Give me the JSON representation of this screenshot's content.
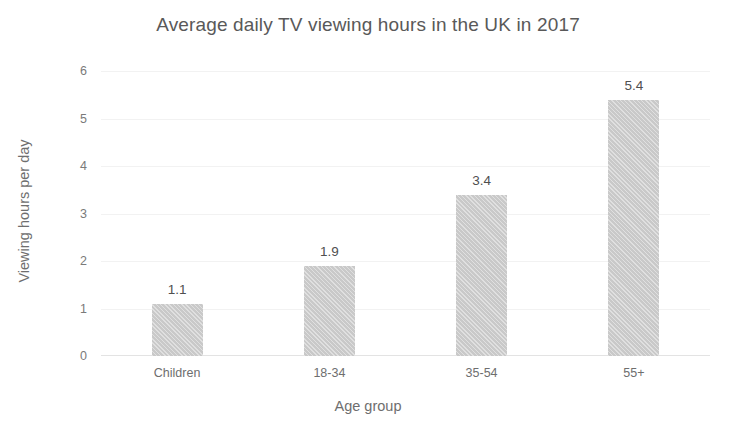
{
  "chart_data": {
    "type": "bar",
    "title": "Average daily TV viewing hours in the UK in 2017",
    "xlabel": "Age group",
    "ylabel": "Viewing hours per day",
    "categories": [
      "Children",
      "18-34",
      "35-54",
      "55+"
    ],
    "values": [
      1.1,
      1.9,
      3.4,
      5.4
    ],
    "value_labels": [
      "1.1",
      "1.9",
      "3.4",
      "5.4"
    ],
    "ylim": [
      0,
      6
    ],
    "ytick_labels": [
      "0",
      "1",
      "2",
      "3",
      "4",
      "5",
      "6"
    ],
    "ytick_values": [
      0,
      1,
      2,
      3,
      4,
      5,
      6
    ],
    "grid": true,
    "grid_axis": "y",
    "legend": false,
    "bar_color": "#c9c9c9",
    "bar_pattern": "diagonal-hatch",
    "text_color": "#6e6e6e",
    "background_color": "#ffffff"
  }
}
